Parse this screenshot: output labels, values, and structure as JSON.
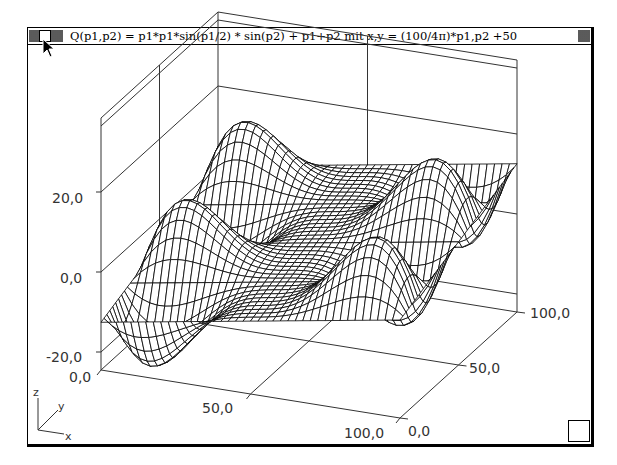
{
  "window": {
    "title": "Q(p1,p2) = p1*p1*sin(p1/2) * sin(p2) + p1+p2 mit x,y = (100/4π)*p1,p2 +50"
  },
  "axis_indicator": {
    "z": "z",
    "y": "y",
    "x": "x"
  },
  "chart_data": {
    "type": "surface-3d-wireframe",
    "title": "Q(p1,p2) = p1*p1*sin(p1/2) * sin(p2) + p1+p2 mit x,y = (100/4π)*p1,p2 +50",
    "function": "z = p1*p1*sin(p1/2)*sin(p2) + p1 + p2, p1 = (x-50)*4π/100, p2 = (y-50)*4π/100",
    "x_range": [
      0,
      100
    ],
    "y_range": [
      0,
      100
    ],
    "z_range": [
      -24.5,
      38.5
    ],
    "grid_resolution": 40,
    "x_ticks": [
      "0,0",
      "50,0",
      "100,0"
    ],
    "y_ticks": [
      "0,0",
      "50,0",
      "100,0"
    ],
    "z_ticks": [
      "-20,0",
      "0,0",
      "20,0"
    ],
    "xlabel": "x",
    "ylabel": "y",
    "zlabel": "z",
    "grid": false,
    "legend": null
  },
  "colors": {
    "line": "#000000",
    "axis": "#333333",
    "background": "#ffffff"
  }
}
